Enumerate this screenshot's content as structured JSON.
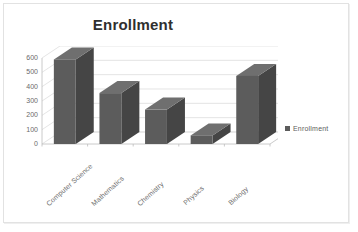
{
  "chart_data": {
    "type": "bar",
    "title": "Enrollment",
    "xlabel": "",
    "ylabel": "",
    "categories": [
      "Computer Science",
      "Mathematics",
      "Chemistry",
      "Physics",
      "Biology"
    ],
    "values": [
      590,
      355,
      240,
      60,
      475
    ],
    "series": [
      {
        "name": "Enrollment",
        "values": [
          590,
          355,
          240,
          60,
          475
        ]
      }
    ],
    "yticks": [
      0,
      100,
      200,
      300,
      400,
      500,
      600
    ],
    "ytick_labels": [
      "0",
      "100",
      "200",
      "300",
      "400",
      "500",
      "600"
    ],
    "ylim": [
      0,
      600
    ],
    "grid": "horizontal",
    "legend_position": "right",
    "legend_entries": [
      "Enrollment"
    ],
    "style": "3d-column",
    "colors": {
      "bar_front": "#5c5c5c",
      "bar_side": "#454545",
      "bar_top": "#6f6f6f",
      "grid": "#d9d9d9",
      "axis": "#bdbdbd",
      "title_text": "#2f2f2f",
      "tick_text": "#6a6a6a",
      "background": "#ffffff",
      "frame": "#e2e2e2"
    }
  },
  "legend": {
    "label": "Enrollment",
    "marker_icon": "square-marker"
  }
}
